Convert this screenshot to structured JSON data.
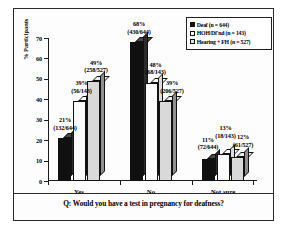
{
  "chart_data": {
    "type": "bar",
    "title": "",
    "subtitle": "",
    "xlabel": "",
    "ylabel": "% Participants",
    "ylim": [
      0,
      70
    ],
    "yticks": [
      0,
      10,
      20,
      30,
      40,
      50,
      60,
      70
    ],
    "grid": false,
    "legend_position": "top-right",
    "categories": [
      "Yes",
      "No",
      "Not sure"
    ],
    "series": [
      {
        "name": "Deaf (n = 644)",
        "legend_label": "Deaf",
        "legend_n": "(n = 644)",
        "color": "#101010",
        "values": [
          21,
          68,
          11
        ],
        "labels_pct": [
          "21%",
          "68%",
          "11%"
        ],
        "labels_frac": [
          "(132/644)",
          "(430/644)",
          "(72/644)"
        ]
      },
      {
        "name": "HOH/Df'nd (n = 143)",
        "legend_label": "HOH/Df'nd",
        "legend_n": "(n = 143)",
        "color": "#ffffff",
        "values": [
          39,
          48,
          13
        ],
        "labels_pct": [
          "39%",
          "48%",
          "13%"
        ],
        "labels_frac": [
          "(56/143)",
          "(68/143)",
          "(18/143)"
        ]
      },
      {
        "name": "Hearing + FH (n = 527)",
        "legend_label": "Hearing + FH",
        "legend_n": "(n = 527)",
        "color": "#d9d9d9",
        "values": [
          49,
          39,
          12
        ],
        "labels_pct": [
          "49%",
          "39%",
          "12%"
        ],
        "labels_frac": [
          "(258/527)",
          "(206/527)",
          "(61/527)"
        ]
      }
    ],
    "caption": "Q: Would you have a test in pregnancy for deafness?"
  },
  "axis": {
    "y_title": "% Participants",
    "y_tick_labels": [
      "0",
      "10",
      "20",
      "30",
      "40",
      "50",
      "60",
      "70"
    ],
    "x_tick_labels": [
      "Yes",
      "No",
      "Not sure"
    ]
  },
  "legend": {
    "entries": [
      {
        "label": "Deaf",
        "n": "(n = 644)"
      },
      {
        "label": "HOH/Df'nd",
        "n": "(n = 143)"
      },
      {
        "label": "Hearing + FH",
        "n": "(n = 527)"
      }
    ]
  },
  "caption": {
    "text": "Q: Would you have a test in pregnancy for deafness?"
  }
}
